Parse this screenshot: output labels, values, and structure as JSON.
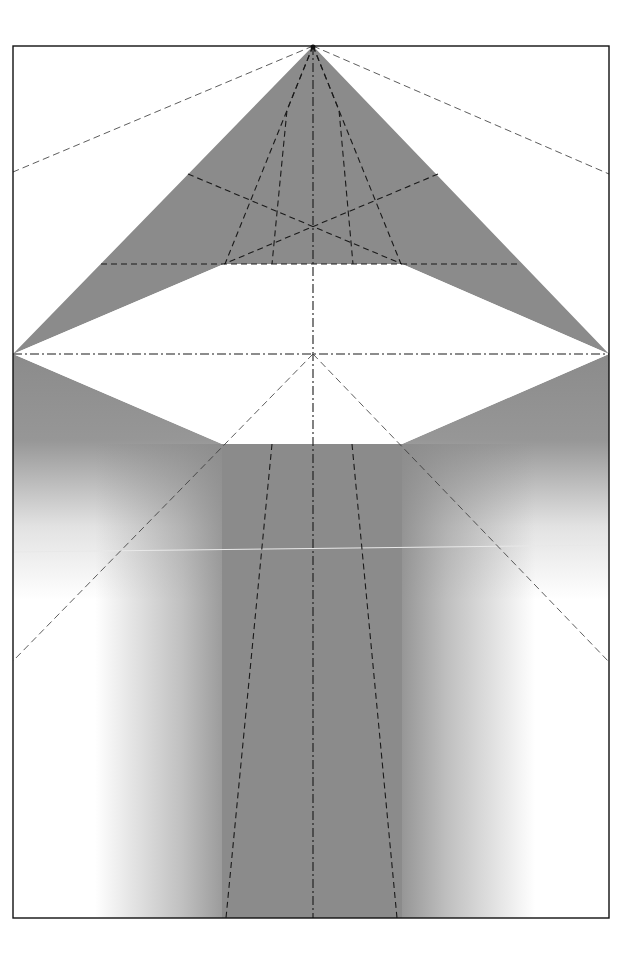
{
  "diagram": {
    "type": "origami-crease-pattern",
    "paper": {
      "x": 13,
      "y": 46,
      "width": 596,
      "height": 872
    },
    "colors": {
      "paper_white": "#ffffff",
      "shade": "#8b8b8b",
      "line": "#1a1a1a",
      "border": "#111111"
    },
    "points": {
      "apex": [
        313,
        46
      ],
      "left_corner": [
        13,
        354
      ],
      "right_corner": [
        609,
        354
      ],
      "center": [
        313,
        354
      ],
      "x_cross": [
        313,
        227
      ],
      "hex_top_left": [
        224,
        264
      ],
      "hex_top_right": [
        402,
        264
      ],
      "hex_bottom_left": [
        222,
        444
      ],
      "hex_bottom_right": [
        402,
        444
      ]
    },
    "regions": [
      {
        "name": "upper-triangle-flap",
        "fill": "solid-shade"
      },
      {
        "name": "center-hexagon",
        "fill": "white"
      },
      {
        "name": "lower-left-flap",
        "fill": "vertical-fade"
      },
      {
        "name": "lower-right-flap",
        "fill": "vertical-fade"
      },
      {
        "name": "center-column",
        "fill": "horizontal-fade-edges"
      }
    ],
    "crease_count": 19
  }
}
